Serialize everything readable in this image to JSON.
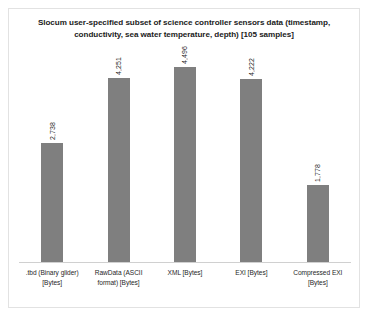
{
  "chart_data": {
    "type": "bar",
    "title": "Slocum user-specified subset of science controller sensors data (timestamp, conductivity, sea water temperature, depth) [105 samples]",
    "categories": [
      ".tbd (Binary glider) [Bytes]",
      "RawData (ASCII format) [Bytes]",
      "XML [Bytes]",
      "EXI [Bytes]",
      "Compressed EXI [Bytes]"
    ],
    "values": [
      2738,
      4251,
      4496,
      4222,
      1778
    ],
    "value_labels": [
      "2,738",
      "4,251",
      "4,496",
      "4,222",
      "1,778"
    ],
    "xlabel": "",
    "ylabel": "",
    "ylim": [
      0,
      5000
    ],
    "grid": false,
    "legend": false,
    "series_color": "#7f7f7f"
  }
}
